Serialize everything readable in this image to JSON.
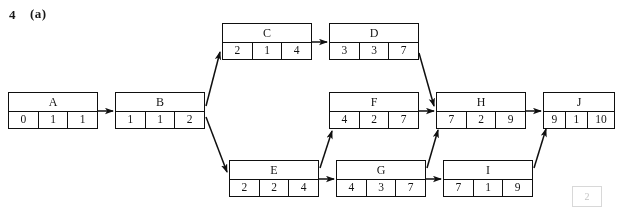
{
  "title": {
    "number": "4",
    "part": "(a)"
  },
  "diagram": {
    "type": "activity-network",
    "nodes": [
      {
        "id": "A",
        "label": "A",
        "values": [
          "0",
          "1",
          "1"
        ],
        "x": 8,
        "y": 92,
        "w": 90,
        "h": 37,
        "wide_last": false
      },
      {
        "id": "B",
        "label": "B",
        "values": [
          "1",
          "1",
          "2"
        ],
        "x": 115,
        "y": 92,
        "w": 90,
        "h": 37,
        "wide_last": false
      },
      {
        "id": "C",
        "label": "C",
        "values": [
          "2",
          "1",
          "4"
        ],
        "x": 222,
        "y": 23,
        "w": 90,
        "h": 37,
        "wide_last": false
      },
      {
        "id": "D",
        "label": "D",
        "values": [
          "3",
          "3",
          "7"
        ],
        "x": 329,
        "y": 23,
        "w": 90,
        "h": 37,
        "wide_last": false
      },
      {
        "id": "E",
        "label": "E",
        "values": [
          "2",
          "2",
          "4"
        ],
        "x": 229,
        "y": 160,
        "w": 90,
        "h": 37,
        "wide_last": false
      },
      {
        "id": "F",
        "label": "F",
        "values": [
          "4",
          "2",
          "7"
        ],
        "x": 329,
        "y": 92,
        "w": 90,
        "h": 37,
        "wide_last": false
      },
      {
        "id": "G",
        "label": "G",
        "values": [
          "4",
          "3",
          "7"
        ],
        "x": 336,
        "y": 160,
        "w": 90,
        "h": 37,
        "wide_last": false
      },
      {
        "id": "H",
        "label": "H",
        "values": [
          "7",
          "2",
          "9"
        ],
        "x": 436,
        "y": 92,
        "w": 90,
        "h": 37,
        "wide_last": false
      },
      {
        "id": "I",
        "label": "I",
        "values": [
          "7",
          "1",
          "9"
        ],
        "x": 443,
        "y": 160,
        "w": 90,
        "h": 37,
        "wide_last": false
      },
      {
        "id": "J",
        "label": "J",
        "values": [
          "9",
          "1",
          "10"
        ],
        "x": 543,
        "y": 92,
        "w": 72,
        "h": 37,
        "wide_last": true
      }
    ],
    "edges": [
      {
        "from": "A",
        "to": "B",
        "kind": "horizontal"
      },
      {
        "from": "B",
        "to": "C",
        "kind": "diagonal-up"
      },
      {
        "from": "B",
        "to": "E",
        "kind": "diagonal-down"
      },
      {
        "from": "C",
        "to": "D",
        "kind": "horizontal"
      },
      {
        "from": "D",
        "to": "H",
        "kind": "diagonal-down"
      },
      {
        "from": "E",
        "to": "F",
        "kind": "diagonal-up"
      },
      {
        "from": "E",
        "to": "G",
        "kind": "horizontal"
      },
      {
        "from": "F",
        "to": "H",
        "kind": "horizontal"
      },
      {
        "from": "G",
        "to": "H",
        "kind": "diagonal-up"
      },
      {
        "from": "G",
        "to": "I",
        "kind": "horizontal"
      },
      {
        "from": "H",
        "to": "J",
        "kind": "horizontal"
      },
      {
        "from": "I",
        "to": "J",
        "kind": "diagonal-up"
      }
    ],
    "colors": {
      "ink": "#111111",
      "background": "#ffffff"
    }
  },
  "scan_residue": {
    "text": "",
    "box_text": "2"
  }
}
